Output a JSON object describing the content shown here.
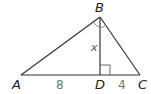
{
  "figure": {
    "type": "right triangle with altitude",
    "vertices": {
      "A": {
        "label": "A",
        "x": 21,
        "y": 75
      },
      "B": {
        "label": "B",
        "x": 100,
        "y": 17
      },
      "C": {
        "label": "C",
        "x": 140,
        "y": 75
      },
      "D": {
        "label": "D",
        "x": 100,
        "y": 75
      }
    },
    "segment_labels": {
      "AD": "8",
      "DC": "4",
      "BD": "x"
    },
    "marks": {
      "right_angle_at": "D",
      "angle_arc_at": "B"
    },
    "colors": {
      "line": "#333333",
      "vertex_label": "#222222",
      "length_label": "#777777",
      "variable_label": "#555555"
    }
  }
}
